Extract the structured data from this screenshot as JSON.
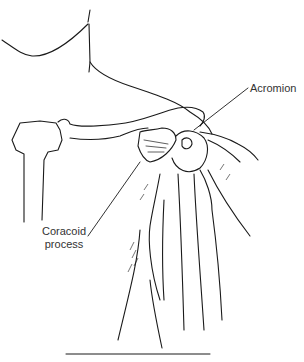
{
  "diagram": {
    "labels": {
      "acromion": "Acromion",
      "coracoid_line1": "Coracoid",
      "coracoid_line2": "process"
    },
    "colors": {
      "ink": "#1a1a1a",
      "background": "#ffffff"
    }
  }
}
